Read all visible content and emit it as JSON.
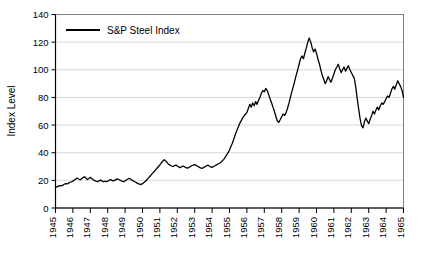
{
  "chart_data": {
    "type": "line",
    "title": "",
    "xlabel": "",
    "ylabel": "Index Level",
    "legend": [
      "S&P Steel Index"
    ],
    "legend_position": "top-left-inside",
    "grid": true,
    "grid_axis": "y",
    "line_color": "#000000",
    "ylim": [
      0,
      140
    ],
    "yticks": [
      0,
      20,
      40,
      60,
      80,
      100,
      120,
      140
    ],
    "ytick_labels": [
      "0",
      "20",
      "40",
      "60",
      "80",
      "100",
      "120",
      "140"
    ],
    "xlim": [
      1945,
      1965
    ],
    "xticks": [
      1945,
      1946,
      1947,
      1948,
      1949,
      1950,
      1951,
      1952,
      1953,
      1954,
      1955,
      1956,
      1957,
      1958,
      1959,
      1960,
      1961,
      1962,
      1963,
      1964,
      1965
    ],
    "xtick_labels": [
      "1945",
      "1946",
      "1947",
      "1948",
      "1949",
      "1950",
      "1951",
      "1952",
      "1953",
      "1954",
      "1955",
      "1956",
      "1957",
      "1958",
      "1959",
      "1960",
      "1961",
      "1962",
      "1963",
      "1964",
      "1965"
    ],
    "xtick_rotation": 90,
    "series": [
      {
        "name": "S&P Steel Index",
        "x": [
          1945.0,
          1945.08,
          1945.17,
          1945.25,
          1945.33,
          1945.42,
          1945.5,
          1945.58,
          1945.67,
          1945.75,
          1945.83,
          1945.92,
          1946.0,
          1946.08,
          1946.17,
          1946.25,
          1946.33,
          1946.42,
          1946.5,
          1946.58,
          1946.67,
          1946.75,
          1946.83,
          1946.92,
          1947.0,
          1947.08,
          1947.17,
          1947.25,
          1947.33,
          1947.42,
          1947.5,
          1947.58,
          1947.67,
          1947.75,
          1947.83,
          1947.92,
          1948.0,
          1948.08,
          1948.17,
          1948.25,
          1948.33,
          1948.42,
          1948.5,
          1948.58,
          1948.67,
          1948.75,
          1948.83,
          1948.92,
          1949.0,
          1949.08,
          1949.17,
          1949.25,
          1949.33,
          1949.42,
          1949.5,
          1949.58,
          1949.67,
          1949.75,
          1949.83,
          1949.92,
          1950.0,
          1950.08,
          1950.17,
          1950.25,
          1950.33,
          1950.42,
          1950.5,
          1950.58,
          1950.67,
          1950.75,
          1950.83,
          1950.92,
          1951.0,
          1951.08,
          1951.17,
          1951.25,
          1951.33,
          1951.42,
          1951.5,
          1951.58,
          1951.67,
          1951.75,
          1951.83,
          1951.92,
          1952.0,
          1952.08,
          1952.17,
          1952.25,
          1952.33,
          1952.42,
          1952.5,
          1952.58,
          1952.67,
          1952.75,
          1952.83,
          1952.92,
          1953.0,
          1953.08,
          1953.17,
          1953.25,
          1953.33,
          1953.42,
          1953.5,
          1953.58,
          1953.67,
          1953.75,
          1953.83,
          1953.92,
          1954.0,
          1954.08,
          1954.17,
          1954.25,
          1954.33,
          1954.42,
          1954.5,
          1954.58,
          1954.67,
          1954.75,
          1954.83,
          1954.92,
          1955.0,
          1955.08,
          1955.17,
          1955.25,
          1955.33,
          1955.42,
          1955.5,
          1955.58,
          1955.67,
          1955.75,
          1955.83,
          1955.92,
          1956.0,
          1956.08,
          1956.17,
          1956.25,
          1956.33,
          1956.42,
          1956.5,
          1956.58,
          1956.67,
          1956.75,
          1956.83,
          1956.92,
          1957.0,
          1957.08,
          1957.17,
          1957.25,
          1957.33,
          1957.42,
          1957.5,
          1957.58,
          1957.67,
          1957.75,
          1957.83,
          1957.92,
          1958.0,
          1958.08,
          1958.17,
          1958.25,
          1958.33,
          1958.42,
          1958.5,
          1958.58,
          1958.67,
          1958.75,
          1958.83,
          1958.92,
          1959.0,
          1959.08,
          1959.17,
          1959.25,
          1959.33,
          1959.42,
          1959.5,
          1959.58,
          1959.67,
          1959.75,
          1959.83,
          1959.92,
          1960.0,
          1960.08,
          1960.17,
          1960.25,
          1960.33,
          1960.42,
          1960.5,
          1960.58,
          1960.67,
          1960.75,
          1960.83,
          1960.92,
          1961.0,
          1961.08,
          1961.17,
          1961.25,
          1961.33,
          1961.42,
          1961.5,
          1961.58,
          1961.67,
          1961.75,
          1961.83,
          1961.92,
          1962.0,
          1962.08,
          1962.17,
          1962.25,
          1962.33,
          1962.42,
          1962.5,
          1962.58,
          1962.67,
          1962.75,
          1962.83,
          1962.92,
          1963.0,
          1963.08,
          1963.17,
          1963.25,
          1963.33,
          1963.42,
          1963.5,
          1963.58,
          1963.67,
          1963.75,
          1963.83,
          1963.92,
          1964.0,
          1964.08,
          1964.17,
          1964.25,
          1964.33,
          1964.42,
          1964.5,
          1964.58,
          1964.67,
          1964.75,
          1964.83,
          1964.92,
          1965.0
        ],
        "values": [
          15.0,
          15.3,
          15.8,
          16.2,
          16.0,
          16.5,
          17.2,
          17.6,
          17.4,
          18.0,
          18.6,
          19.0,
          19.4,
          20.2,
          21.0,
          21.6,
          21.0,
          20.4,
          21.2,
          22.0,
          22.6,
          21.6,
          20.6,
          21.4,
          22.2,
          21.4,
          20.4,
          19.8,
          19.4,
          19.0,
          19.6,
          20.2,
          19.6,
          19.0,
          19.4,
          19.0,
          19.4,
          20.0,
          20.6,
          20.0,
          19.6,
          20.2,
          20.8,
          21.0,
          20.4,
          19.8,
          19.4,
          19.0,
          19.6,
          20.4,
          21.0,
          21.4,
          20.8,
          20.0,
          19.4,
          18.8,
          18.2,
          17.6,
          17.2,
          17.0,
          17.6,
          18.4,
          19.4,
          20.4,
          21.6,
          22.8,
          24.0,
          25.2,
          26.4,
          27.6,
          28.8,
          30.0,
          31.2,
          32.6,
          34.0,
          35.0,
          34.0,
          32.8,
          31.6,
          31.0,
          30.4,
          30.0,
          30.6,
          31.0,
          30.4,
          29.8,
          29.2,
          29.8,
          30.4,
          29.8,
          29.2,
          28.8,
          29.4,
          30.0,
          30.6,
          31.0,
          31.4,
          30.8,
          30.2,
          29.6,
          29.0,
          28.6,
          29.2,
          29.8,
          30.4,
          31.0,
          30.4,
          29.8,
          29.4,
          30.0,
          30.6,
          31.2,
          31.8,
          32.4,
          33.0,
          34.0,
          35.2,
          36.6,
          38.2,
          40.0,
          42.0,
          44.5,
          47.0,
          50.0,
          53.0,
          56.0,
          58.5,
          61.0,
          63.0,
          65.0,
          66.5,
          68.0,
          69.0,
          72.0,
          75.0,
          73.0,
          76.0,
          74.0,
          77.0,
          75.0,
          78.0,
          80.0,
          83.0,
          85.0,
          84.0,
          86.5,
          85.0,
          82.0,
          79.0,
          76.0,
          73.0,
          70.0,
          66.0,
          63.0,
          62.0,
          64.0,
          66.0,
          68.0,
          67.0,
          69.0,
          72.0,
          76.0,
          80.0,
          84.0,
          88.0,
          92.0,
          96.0,
          100.0,
          104.0,
          108.0,
          110.0,
          108.0,
          112.0,
          116.0,
          120.0,
          123.0,
          120.0,
          116.0,
          113.0,
          115.0,
          112.0,
          108.0,
          104.0,
          100.0,
          96.0,
          93.0,
          90.0,
          92.0,
          95.0,
          93.0,
          91.0,
          94.0,
          97.0,
          100.0,
          102.0,
          104.0,
          101.0,
          98.0,
          100.0,
          102.0,
          99.0,
          101.0,
          103.0,
          100.0,
          98.0,
          96.0,
          94.0,
          88.0,
          80.0,
          72.0,
          65.0,
          60.0,
          58.0,
          62.0,
          65.0,
          63.0,
          61.0,
          64.0,
          67.0,
          70.0,
          68.0,
          71.0,
          73.0,
          71.0,
          74.0,
          76.0,
          75.0,
          77.0,
          79.0,
          81.0,
          80.0,
          83.0,
          86.0,
          88.0,
          86.0,
          89.0,
          92.0,
          90.0,
          88.0,
          85.0,
          80.0
        ]
      }
    ]
  }
}
